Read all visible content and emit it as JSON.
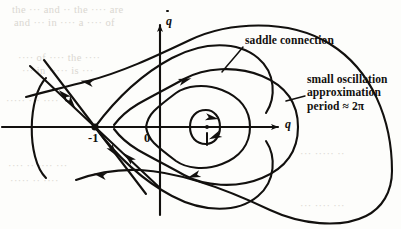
{
  "figure": {
    "kind": "phase-portrait",
    "caption_visible": false,
    "background_color": "#fdfdfb",
    "ink_color": "#12100e"
  },
  "axes": {
    "x_label": "q",
    "y_label": "q",
    "y_label_has_dot": true,
    "x_axis_y": 127,
    "y_axis_x": 160,
    "x_arrow_tip": [
      278,
      127
    ],
    "y_arrow_tip": [
      160,
      19
    ]
  },
  "points": [
    {
      "name": "saddle-point",
      "label": "-1",
      "x": 95,
      "y": 127,
      "label_x": 88,
      "label_y": 131,
      "type": "saddle"
    },
    {
      "name": "origin-label",
      "label": "0",
      "x": 160,
      "y": 127,
      "label_x": 144,
      "label_y": 131,
      "type": "origin-tick"
    },
    {
      "name": "center-point",
      "label": "",
      "x": 207,
      "y": 127,
      "type": "center"
    }
  ],
  "annotations": [
    {
      "name": "saddle-connection",
      "text": "saddle connection",
      "x": 245,
      "y": 41,
      "leader_from": [
        243,
        47
      ],
      "leader_to": [
        222,
        72
      ]
    },
    {
      "name": "small-oscillation-note",
      "lines": [
        "small oscillation",
        "approximation",
        "period ≈ 2π"
      ],
      "x": 307,
      "y": 79,
      "leader_from": [
        305,
        96
      ],
      "leader_to": [
        286,
        101
      ]
    }
  ],
  "bleed_text": [
    {
      "text": "the   ···   and  ··   the  ····  are",
      "x": 12,
      "y": 4
    },
    {
      "text": "and  ···  in   ····  a    ····  of",
      "x": 14,
      "y": 17
    },
    {
      "text": "····  of   ····  the  ····",
      "x": 18,
      "y": 52
    },
    {
      "text": "···  in  ·····  is  ···",
      "x": 22,
      "y": 65
    },
    {
      "text": "·····  ···  ····",
      "x": 6,
      "y": 95
    },
    {
      "text": "···  ·····  ··",
      "x": 300,
      "y": 148
    },
    {
      "text": "····  ··  ····  ···",
      "x": 8,
      "y": 160
    },
    {
      "text": "·····  ··  ····",
      "x": 10,
      "y": 175
    },
    {
      "text": "···  ····  ···",
      "x": 300,
      "y": 200
    }
  ],
  "curves": {
    "saddle_connection_upper": "M 95 127 C 118 96 142 74 172 58 C 204 41 238 41 258 58 C 276 73 276 98 266 113",
    "saddle_connection_lower": "M 95 127 C 118 158 142 180 172 196 C 204 213 238 213 258 196 C 276 181 276 156 266 141",
    "outer_orbit_upper": "M 392 171 C 392 120 372 70 330 44 C 288 18 228 22 190 40 C 152 58 122 72 88 81 C 66 87 44 92 26 97",
    "outer_orbit_lower": "M 392 171 C 392 192 382 208 366 216 C 340 229 300 224 270 210 C 230 191 180 172 140 170 C 118 169 98 172 76 180",
    "mid_orbit_upper": "M 298 127 C 298 104 286 86 262 76 C 236 65 204 68 184 79 C 168 88 152 96 138 104 C 128 110 120 117 114 125",
    "mid_orbit_lower": "M 298 127 C 298 150 286 168 262 178 C 236 189 204 186 184 175 C 168 166 152 158 138 150 C 128 144 120 137 114 129",
    "inner_orbit_upper": "M 250 127 C 250 110 240 97 222 90 C 204 83 186 86 176 93 C 168 99 160 105 154 111 C 150 115 147 121 146 127",
    "inner_orbit_lower": "M 250 127 C 250 144 240 157 222 164 C 204 171 186 168 176 161 C 168 155 160 149 154 143 C 150 139 147 133 146 127",
    "center_ellipse": "M 220 127 C 220 117 214 110 206 110 C 196 110 190 117 190 127 C 190 137 196 144 206 144 C 214 144 220 137 220 127",
    "stable_manifold_in_upper": "M 44 60 L 95 127",
    "stable_manifold_out_lower": "M 95 127 L 146 194",
    "unstable_manifold_in_lower": "M 160 188 L 95 127",
    "unstable_manifold_out_upper": "M 95 127 L 30 66",
    "left_arc": "M 46 78 C 28 96 26 158 46 178"
  },
  "arrows": [
    {
      "name": "arrow-outer-upper-left",
      "x": 86,
      "y": 82,
      "angle": 192
    },
    {
      "name": "arrow-outer-lower-left",
      "x": 99,
      "y": 175,
      "angle": 192
    },
    {
      "name": "arrow-stable-in-upper",
      "x": 72,
      "y": 104,
      "angle": 52
    },
    {
      "name": "arrow-unstable-out-lower",
      "x": 114,
      "y": 152,
      "angle": 52
    },
    {
      "name": "arrow-unstable-in-lower",
      "x": 128,
      "y": 157,
      "angle": 223
    },
    {
      "name": "arrow-stable-out-upper",
      "x": 63,
      "y": 94,
      "angle": 223
    },
    {
      "name": "arrow-mid-orbit-top",
      "x": 186,
      "y": 80,
      "angle": 342
    },
    {
      "name": "arrow-mid-orbit-bottom",
      "x": 193,
      "y": 176,
      "angle": 162
    },
    {
      "name": "arrow-inner-orbit-top",
      "x": 213,
      "y": 118,
      "angle": 10
    },
    {
      "name": "arrow-center-ellipse",
      "x": 214,
      "y": 137,
      "angle": 155
    }
  ]
}
